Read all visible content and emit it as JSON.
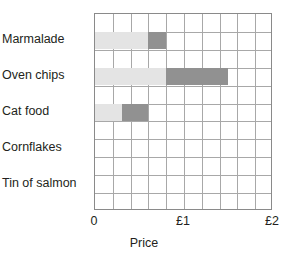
{
  "chart_data": {
    "type": "bar",
    "orientation": "horizontal",
    "stacked": true,
    "title": "",
    "xlabel": "Price",
    "ylabel": "",
    "xlim": [
      0,
      2
    ],
    "xticks": [
      {
        "value": 0,
        "label": "0"
      },
      {
        "value": 1,
        "label": "£1"
      },
      {
        "value": 2,
        "label": "£2"
      }
    ],
    "grid": true,
    "grid_step_x": 0.2,
    "grid_rows": 11,
    "currency": "£",
    "categories": [
      "Marmalade",
      "Oven chips",
      "Cat food",
      "Cornflakes",
      "Tin of salmon"
    ],
    "series": [
      {
        "name": "segment-1",
        "color": "#e4e4e4",
        "values": [
          0.6,
          0.8,
          0.3,
          0,
          0
        ]
      },
      {
        "name": "segment-2",
        "color": "#919191",
        "values": [
          0.2,
          0.7,
          0.3,
          0,
          0
        ]
      }
    ],
    "totals": [
      0.8,
      1.5,
      0.6,
      0,
      0
    ],
    "rows": [
      {
        "label": "Marmalade",
        "row_index": 1,
        "segments": [
          {
            "start": 0,
            "end": 0.6,
            "color": "#e4e4e4"
          },
          {
            "start": 0.6,
            "end": 0.8,
            "color": "#919191"
          }
        ]
      },
      {
        "label": "Oven chips",
        "row_index": 3,
        "segments": [
          {
            "start": 0,
            "end": 0.8,
            "color": "#e4e4e4"
          },
          {
            "start": 0.8,
            "end": 1.5,
            "color": "#919191"
          }
        ]
      },
      {
        "label": "Cat food",
        "row_index": 5,
        "segments": [
          {
            "start": 0,
            "end": 0.3,
            "color": "#e4e4e4"
          },
          {
            "start": 0.3,
            "end": 0.6,
            "color": "#919191"
          }
        ]
      },
      {
        "label": "Cornflakes",
        "row_index": 7,
        "segments": []
      },
      {
        "label": "Tin of salmon",
        "row_index": 9,
        "segments": []
      }
    ],
    "colors": {
      "light": "#e4e4e4",
      "dark": "#919191",
      "grid": "#a8a8a8",
      "frame": "#8a8a8a",
      "text": "#231f20",
      "background": "#ffffff"
    }
  }
}
